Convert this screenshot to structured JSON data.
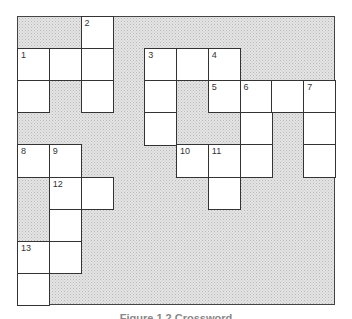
{
  "puzzle": {
    "type": "crossword-grid",
    "rows": 9,
    "cols": 10,
    "colors": {
      "white_cell": "#ffffff",
      "shaded": "#e4e4e4",
      "line": "#333333"
    },
    "cells": [
      {
        "r": 0,
        "c": 2,
        "n": "2"
      },
      {
        "r": 1,
        "c": 0,
        "n": "1"
      },
      {
        "r": 1,
        "c": 1,
        "n": ""
      },
      {
        "r": 1,
        "c": 2,
        "n": ""
      },
      {
        "r": 1,
        "c": 4,
        "n": "3"
      },
      {
        "r": 1,
        "c": 5,
        "n": ""
      },
      {
        "r": 1,
        "c": 6,
        "n": "4"
      },
      {
        "r": 2,
        "c": 0,
        "n": ""
      },
      {
        "r": 2,
        "c": 2,
        "n": ""
      },
      {
        "r": 2,
        "c": 4,
        "n": ""
      },
      {
        "r": 2,
        "c": 6,
        "n": "5"
      },
      {
        "r": 2,
        "c": 7,
        "n": "6"
      },
      {
        "r": 2,
        "c": 8,
        "n": ""
      },
      {
        "r": 2,
        "c": 9,
        "n": "7"
      },
      {
        "r": 3,
        "c": 4,
        "n": ""
      },
      {
        "r": 3,
        "c": 7,
        "n": ""
      },
      {
        "r": 3,
        "c": 9,
        "n": ""
      },
      {
        "r": 4,
        "c": 0,
        "n": "8"
      },
      {
        "r": 4,
        "c": 1,
        "n": "9"
      },
      {
        "r": 4,
        "c": 5,
        "n": "10"
      },
      {
        "r": 4,
        "c": 6,
        "n": "11"
      },
      {
        "r": 4,
        "c": 7,
        "n": ""
      },
      {
        "r": 4,
        "c": 9,
        "n": ""
      },
      {
        "r": 5,
        "c": 1,
        "n": "12"
      },
      {
        "r": 5,
        "c": 2,
        "n": ""
      },
      {
        "r": 5,
        "c": 6,
        "n": ""
      },
      {
        "r": 6,
        "c": 1,
        "n": ""
      },
      {
        "r": 7,
        "c": 0,
        "n": "13"
      },
      {
        "r": 7,
        "c": 1,
        "n": ""
      },
      {
        "r": 8,
        "c": 0,
        "n": ""
      }
    ]
  },
  "caption": "Figure 1.2  Crossword"
}
